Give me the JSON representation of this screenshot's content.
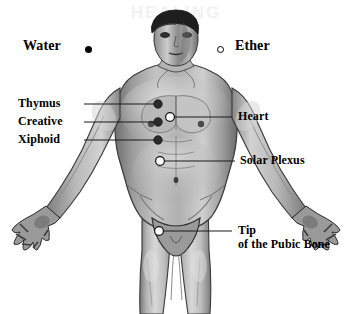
{
  "diagram": {
    "figure_description": "Grayscale front-view anatomical drawing of a standing male figure, arms outstretched downward, cropped at the knees",
    "background_color": "#ffffff",
    "line_color": "#1a1a1a",
    "text_color": "#000000"
  },
  "legend": {
    "items": [
      {
        "label": "Water",
        "marker": "filled-dot",
        "marker_style": "solid black circle",
        "side": "left"
      },
      {
        "label": "Ether",
        "marker": "hollow-dot",
        "marker_style": "open white circle with black outline",
        "side": "right"
      }
    ]
  },
  "left_labels": [
    {
      "text": "Thymus",
      "marker": "filled-dot"
    },
    {
      "text": "Creative",
      "marker": "filled-dot"
    },
    {
      "text": "Xiphoid",
      "marker": "filled-dot"
    }
  ],
  "right_labels": [
    {
      "text": "Heart",
      "marker": "hollow-dot",
      "lines": [
        "Heart"
      ]
    },
    {
      "text": "Solar Plexus",
      "marker": "hollow-dot",
      "lines": [
        "Solar Plexus"
      ]
    },
    {
      "text": "Tip of the Pubic Bone",
      "marker": "hollow-dot",
      "lines": [
        "Tip",
        "of the Pubic Bone"
      ]
    }
  ],
  "points": [
    {
      "name": "thymus",
      "marker": "filled-dot",
      "x": 158,
      "y": 104
    },
    {
      "name": "creative",
      "marker": "filled-dot",
      "x": 158,
      "y": 122
    },
    {
      "name": "xiphoid",
      "marker": "filled-dot",
      "x": 158,
      "y": 140
    },
    {
      "name": "heart",
      "marker": "hollow-dot",
      "x": 170,
      "y": 117
    },
    {
      "name": "solar-plexus",
      "marker": "hollow-dot",
      "x": 160,
      "y": 161
    },
    {
      "name": "tip-pubic-bone",
      "marker": "hollow-dot",
      "x": 159,
      "y": 231
    }
  ]
}
